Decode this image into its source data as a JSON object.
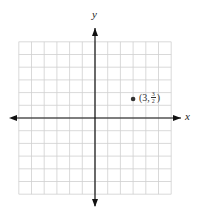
{
  "chart_data": {
    "type": "scatter",
    "title": "",
    "xlabel": "x",
    "ylabel": "y",
    "xlim": [
      -6,
      6
    ],
    "ylim": [
      -6,
      6
    ],
    "grid": true,
    "legend": null,
    "series": [
      {
        "name": "point",
        "x": [
          3
        ],
        "y": [
          1.5
        ]
      }
    ],
    "annotations": [
      {
        "x": 3,
        "y": 1.5,
        "text": "(3, 3/2)"
      }
    ]
  },
  "labels": {
    "x_axis": "x",
    "y_axis": "y",
    "point_open": "(3,",
    "point_num": "3",
    "point_den": "2",
    "point_close": ")"
  },
  "colors": {
    "grid": "#cfcfcf",
    "axis": "#111111",
    "point": "#333333"
  }
}
